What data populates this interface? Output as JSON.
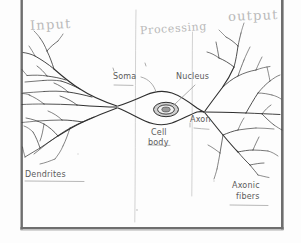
{
  "figure": {
    "kind": "hand-drawn-diagram",
    "background_color": "#fdfdfd",
    "frame_color": "#6e6e6e",
    "ink_color": "#2b2b2b",
    "pencil_color": "#b9b9b9",
    "label_color": "#5a5a5a"
  },
  "zones": {
    "input_label": "Input",
    "processing_label": "Processing",
    "output_label": "output"
  },
  "labels": {
    "soma": "Soma",
    "nucleus": "Nucleus",
    "cell_body_line1": "Cell",
    "cell_body_line2": "body",
    "axon": "Axon",
    "dendrites": "Dendrites",
    "axonic_fibers_line1": "Axonic",
    "axonic_fibers_line2": "fibers"
  },
  "structure": {
    "dendrite_convergence_x": 118,
    "dendrite_convergence_y": 107,
    "soma_center_x": 166,
    "soma_center_y": 110,
    "nucleus_center_x": 166,
    "nucleus_center_y": 109,
    "axon_hillock_x": 203,
    "axon_hillock_y": 112,
    "axon_terminal_x": 212,
    "axon_terminal_y": 113
  }
}
